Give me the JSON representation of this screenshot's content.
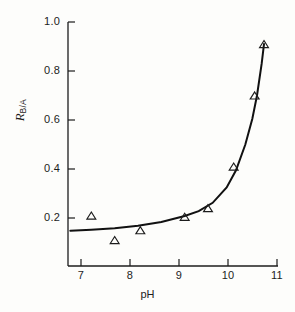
{
  "chart_data": {
    "type": "scatter",
    "title": "",
    "subtitle": "",
    "xlabel": "pH",
    "ylabel_symbol": "R",
    "ylabel_subscript": "B/A",
    "ylabel": "R B/A",
    "xlim": [
      6.5,
      11.0
    ],
    "ylim": [
      0.0,
      1.05
    ],
    "xticks": [
      7,
      8,
      9,
      10,
      11
    ],
    "xtick_labels": [
      "7",
      "8",
      "9",
      "10",
      "11"
    ],
    "yticks": [
      0.2,
      0.4,
      0.6,
      0.8,
      1.0
    ],
    "ytick_labels": [
      "0.2",
      "0.4",
      "0.6",
      "0.8",
      "1.0"
    ],
    "grid": false,
    "legend": null,
    "marker": "open-triangle",
    "series": [
      {
        "name": "R_B/A vs pH",
        "x": [
          7.0,
          7.5,
          8.05,
          9.0,
          9.5,
          10.05,
          10.5,
          10.7
        ],
        "y": [
          0.21,
          0.11,
          0.15,
          0.205,
          0.24,
          0.41,
          0.7,
          0.91
        ]
      }
    ],
    "fit_curve": {
      "name": "titration fit",
      "x": [
        6.55,
        7.0,
        7.5,
        8.0,
        8.5,
        9.0,
        9.3,
        9.6,
        9.9,
        10.1,
        10.3,
        10.45,
        10.55,
        10.65,
        10.7
      ],
      "y": [
        0.148,
        0.152,
        0.158,
        0.168,
        0.184,
        0.208,
        0.228,
        0.262,
        0.325,
        0.395,
        0.5,
        0.605,
        0.7,
        0.83,
        0.91
      ]
    }
  },
  "axes": {
    "x_title": "pH",
    "y_title_symbol": "R",
    "y_title_subscript": "B/A"
  }
}
